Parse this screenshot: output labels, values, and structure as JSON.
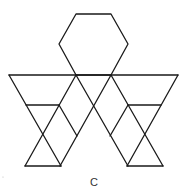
{
  "figure": {
    "label": "C",
    "stroke_color": "#1a1a1a",
    "background": "#ffffff",
    "hexagon": {
      "points": [
        [
          76,
          14
        ],
        [
          111,
          14
        ],
        [
          128,
          44
        ],
        [
          111,
          75
        ],
        [
          76,
          75
        ],
        [
          59,
          44
        ]
      ]
    },
    "top_line": {
      "x1": 9,
      "y1": 75,
      "x2": 178,
      "y2": 75
    },
    "segments": [
      {
        "x1": 9,
        "y1": 75,
        "x2": 61,
        "y2": 166
      },
      {
        "x1": 76,
        "y1": 75,
        "x2": 25,
        "y2": 166
      },
      {
        "x1": 26,
        "y1": 105,
        "x2": 59,
        "y2": 105
      },
      {
        "x1": 25,
        "y1": 166,
        "x2": 61,
        "y2": 166
      },
      {
        "x1": 59,
        "y1": 105,
        "x2": 77,
        "y2": 136
      },
      {
        "x1": 76,
        "y1": 75,
        "x2": 128,
        "y2": 166
      },
      {
        "x1": 111,
        "y1": 75,
        "x2": 60,
        "y2": 166
      },
      {
        "x1": 111,
        "y1": 75,
        "x2": 163,
        "y2": 166
      },
      {
        "x1": 178,
        "y1": 75,
        "x2": 127,
        "y2": 166
      },
      {
        "x1": 128,
        "y1": 105,
        "x2": 161,
        "y2": 105
      },
      {
        "x1": 127,
        "y1": 166,
        "x2": 163,
        "y2": 166
      },
      {
        "x1": 128,
        "y1": 105,
        "x2": 110,
        "y2": 136
      }
    ],
    "label_position": {
      "x": 94,
      "y": 188
    }
  }
}
